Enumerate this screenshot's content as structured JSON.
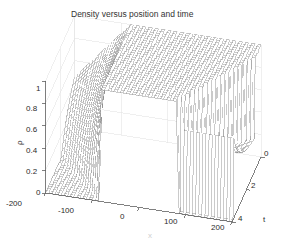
{
  "figure": {
    "kind": "matlab-3d-mesh-plot",
    "background_color": "#ffffff",
    "mesh_line_color": "#8a8a8a",
    "axis_line_color": "#606060",
    "grid_line_color": "#e2e2e2",
    "text_color": "#2b2b2b"
  },
  "chart_data": {
    "type": "line",
    "render": "3d-wireframe-mesh-surface",
    "title": "Density versus position and time",
    "xlabel": "x",
    "ylabel": "t",
    "zlabel": "ρ",
    "grid": true,
    "legend": "none",
    "xlim": [
      -200,
      200
    ],
    "ylim": [
      0,
      4
    ],
    "zlim": [
      0,
      1
    ],
    "xticks": [
      -200,
      -100,
      0,
      100,
      200
    ],
    "xticklabels": [
      "-200",
      "-100",
      "0",
      "100",
      "200"
    ],
    "yticks": [
      0,
      2,
      4
    ],
    "yticklabels": [
      "0",
      "2",
      "4"
    ],
    "zticks": [
      0,
      0.2,
      0.4,
      0.6,
      0.8,
      1
    ],
    "zticklabels": [
      "0",
      "0.2",
      "0.4",
      "0.6",
      "0.8",
      "1"
    ],
    "view": {
      "azimuth": -37.5,
      "elevation": 30
    },
    "surface_model": {
      "rho_max": 1.0,
      "rho_far_left": 0.0,
      "rho_far_right": 0.0,
      "box_left": -80,
      "box_right": 80,
      "rarefaction_speed_left": -1.0,
      "shock_speed_right": 0.5,
      "nx": 61,
      "nt": 31
    },
    "x": [
      -200,
      -190,
      -180,
      -170,
      -160,
      -150,
      -140,
      -130,
      -120,
      -110,
      -100,
      -90,
      -80,
      -70,
      -60,
      -50,
      -40,
      -30,
      -20,
      -10,
      0,
      10,
      20,
      30,
      40,
      50,
      60,
      70,
      80,
      90,
      100,
      110,
      120,
      130,
      140,
      150,
      160,
      170,
      180,
      190,
      200
    ],
    "t": [
      0,
      0.5,
      1,
      1.5,
      2,
      2.5,
      3,
      3.5,
      4
    ],
    "series": [
      {
        "name": "t=0",
        "values": [
          0,
          0,
          0,
          0,
          0,
          0,
          0,
          0,
          0,
          0,
          0,
          0,
          1,
          1,
          1,
          1,
          1,
          1,
          1,
          1,
          1,
          1,
          1,
          1,
          1,
          1,
          1,
          1,
          1,
          0,
          0,
          0,
          0,
          0,
          0,
          0,
          0,
          0,
          0,
          0,
          0
        ]
      },
      {
        "name": "t=1",
        "values": [
          0,
          0,
          0,
          0,
          0,
          0,
          0,
          0,
          0,
          0,
          0,
          0.12,
          0.3,
          0.48,
          0.66,
          0.84,
          1,
          1,
          1,
          1,
          1,
          1,
          1,
          1,
          1,
          1,
          1,
          1,
          1,
          1,
          0.55,
          0,
          0,
          0,
          0,
          0,
          0,
          0,
          0,
          0,
          0
        ]
      },
      {
        "name": "t=2",
        "values": [
          0,
          0,
          0,
          0,
          0,
          0,
          0,
          0,
          0,
          0.05,
          0.16,
          0.27,
          0.38,
          0.5,
          0.61,
          0.72,
          0.83,
          0.94,
          1,
          1,
          1,
          1,
          1,
          1,
          1,
          1,
          1,
          1,
          1,
          1,
          1,
          0.52,
          0.48,
          0.47,
          0.46,
          0.46,
          0.46,
          0.45,
          0.45,
          0.45,
          0.45
        ]
      },
      {
        "name": "t=3",
        "values": [
          0,
          0,
          0,
          0,
          0,
          0,
          0.03,
          0.11,
          0.19,
          0.27,
          0.35,
          0.43,
          0.51,
          0.59,
          0.67,
          0.75,
          0.83,
          0.91,
          0.99,
          1,
          1,
          1,
          1,
          1,
          1,
          1,
          1,
          0.6,
          0.52,
          0.5,
          0.49,
          0.48,
          0.47,
          0.47,
          0.46,
          0.46,
          0.46,
          0.45,
          0.45,
          0.45,
          0.45
        ]
      },
      {
        "name": "t=4",
        "values": [
          0,
          0,
          0,
          0.02,
          0.08,
          0.14,
          0.2,
          0.26,
          0.32,
          0.38,
          0.44,
          0.5,
          0.56,
          0.62,
          0.68,
          0.74,
          0.8,
          0.86,
          0.92,
          0.98,
          1,
          1,
          0.7,
          0.58,
          0.53,
          0.51,
          0.5,
          0.49,
          0.48,
          0.48,
          0.47,
          0.47,
          0.46,
          0.46,
          0.46,
          0.45,
          0.45,
          0.45,
          0.45,
          0.45,
          0.45
        ]
      }
    ]
  },
  "labels": {
    "title": "Density versus position and time",
    "x_axis_name": "x",
    "y_axis_name": "t",
    "z_axis_name": "ρ",
    "x_ticks": [
      "-200",
      "-100",
      "0",
      "100",
      "200"
    ],
    "y_ticks": [
      "0",
      "2",
      "4"
    ],
    "z_ticks": [
      "1",
      "0.8",
      "0.6",
      "0.4",
      "0.2",
      "0"
    ]
  }
}
